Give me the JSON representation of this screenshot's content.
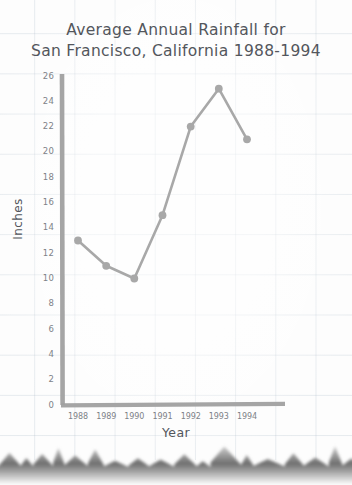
{
  "chart_data": {
    "type": "line",
    "title": "Average Annual Rainfall for San Francisco, California 1988-1994",
    "title_lines": [
      "Average Annual Rainfall for",
      "San Francisco, California 1988-1994"
    ],
    "xlabel": "Year",
    "ylabel": "Inches",
    "categories": [
      "1988",
      "1989",
      "1990",
      "1991",
      "1992",
      "1993",
      "1994"
    ],
    "values": [
      13,
      11,
      10,
      15,
      22,
      25,
      21
    ],
    "ylim": [
      0,
      26
    ],
    "ytick_labels": [
      "0",
      "2",
      "4",
      "6",
      "8",
      "10",
      "12",
      "14",
      "16",
      "18",
      "20",
      "22",
      "24",
      "26"
    ],
    "ytick_values": [
      0,
      2,
      4,
      6,
      8,
      10,
      12,
      14,
      16,
      18,
      20,
      22,
      24,
      26
    ],
    "grid": true,
    "legend": null,
    "series_color": "#a8a8a8",
    "axis_color": "#a0a0a0",
    "text_color": "#53565c",
    "grid_color": "#b2c0cd",
    "background": "#fdfdfd"
  }
}
